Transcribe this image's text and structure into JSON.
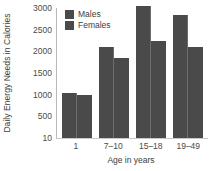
{
  "chart_data": {
    "type": "bar",
    "title": "",
    "xlabel": "Age in years",
    "ylabel": "Daily Energy Needs in Calories",
    "categories": [
      "1",
      "7–10",
      "15–18",
      "19–49"
    ],
    "series": [
      {
        "name": "Males",
        "values": [
          1050,
          2100,
          3050,
          2850
        ],
        "color": "#4a4a4a"
      },
      {
        "name": "Females",
        "values": [
          1000,
          1850,
          2250,
          2100
        ],
        "color": "#4a4a4a"
      }
    ],
    "yticks": [
      10,
      500,
      1000,
      1500,
      2000,
      2500,
      3000
    ],
    "ytick_labels": [
      "10",
      "500",
      "1000",
      "1500",
      "2000",
      "2500",
      "3000"
    ],
    "ylim": [
      10,
      3150
    ],
    "grid": false,
    "legend_position": "top-left",
    "legend": [
      "Males",
      "Females"
    ],
    "bar_color": "#4a4a4a",
    "axis_color": "#b9b9b9",
    "background": "#ffffff"
  }
}
